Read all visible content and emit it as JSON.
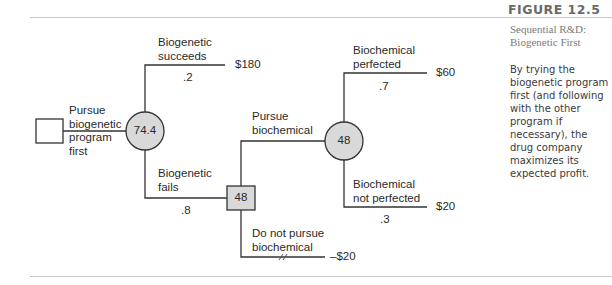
{
  "figure": {
    "number": "FIGURE 12.5",
    "subtitle": "Sequential R&D: Biogenetic First",
    "caption": "By trying the biogenetic program first (and following with the other program if necessary), the drug company maximizes its expected profit."
  },
  "tree": {
    "root": {
      "label_lines": [
        "Pursue",
        "biogenetic",
        "program",
        "first"
      ]
    },
    "chance1": {
      "value": "74.4",
      "branches": [
        {
          "label_lines": [
            "Biogenetic",
            "succeeds"
          ],
          "prob": ".2",
          "payoff": "$180"
        },
        {
          "label_lines": [
            "Biogenetic",
            "fails"
          ],
          "prob": ".8"
        }
      ]
    },
    "decision2": {
      "value": "48",
      "branches": [
        {
          "label_lines": [
            "Pursue",
            "biochemical"
          ]
        },
        {
          "label_lines": [
            "Do not pursue",
            "biochemical"
          ],
          "payoff": "–$20",
          "pruned": true
        }
      ]
    },
    "chance2": {
      "value": "48",
      "branches": [
        {
          "label_lines": [
            "Biochemical",
            "perfected"
          ],
          "prob": ".7",
          "payoff": "$60"
        },
        {
          "label_lines": [
            "Biochemical",
            "not perfected"
          ],
          "prob": ".3",
          "payoff": "$20"
        }
      ]
    }
  },
  "colors": {
    "line": "#333333",
    "node_fill": "#d9d9d9",
    "rule": "#c9c9c9",
    "title": "#6a6a6a"
  }
}
